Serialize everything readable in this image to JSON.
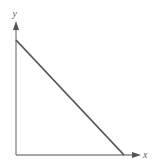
{
  "diagram": {
    "type": "linear-graph",
    "axes": {
      "x_label": "x",
      "y_label": "y"
    },
    "line": {
      "description": "straight line with negative slope from y-intercept to x-intercept",
      "start": {
        "x": 16,
        "y": 40
      },
      "end": {
        "x": 124,
        "y": 155
      }
    },
    "colors": {
      "axis": "#8a8a8a",
      "line": "#555555",
      "label": "#666666"
    }
  }
}
